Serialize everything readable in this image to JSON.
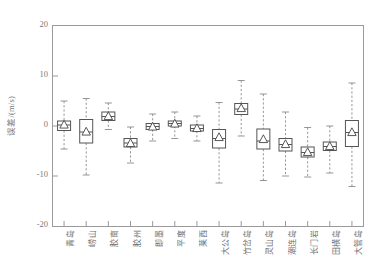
{
  "chart_data": {
    "type": "boxplot",
    "title": "",
    "xlabel": "",
    "ylabel": "误差/(m/s)",
    "ylim": [
      -20,
      20
    ],
    "yticks": [
      20,
      10,
      0,
      -10,
      -20
    ],
    "ytick_labels": [
      "20",
      "10",
      "0",
      "-10",
      "-20"
    ],
    "grid": false,
    "legend": null,
    "marker_note": "triangle = mean, horizontal line in box = median, dashed lines = whiskers",
    "categories": [
      "青岛",
      "崂山",
      "胶南",
      "胶州",
      "即墨",
      "平度",
      "莱西",
      "大公岛",
      "竹岔岛",
      "灵山岛",
      "潮连岛",
      "长门岩",
      "田横岛",
      "大管岛"
    ],
    "boxes": [
      {
        "category": "青岛",
        "whisker_low": -4.6,
        "q1": -0.9,
        "median": 0.2,
        "mean": 0.3,
        "q3": 1.0,
        "whisker_high": 5.0
      },
      {
        "category": "崂山",
        "whisker_low": -9.8,
        "q1": -3.4,
        "median": -1.2,
        "mean": -1.1,
        "q3": 1.3,
        "whisker_high": 5.5
      },
      {
        "category": "胶南",
        "whisker_low": -0.7,
        "q1": 1.1,
        "median": 1.9,
        "mean": 2.0,
        "q3": 2.8,
        "whisker_high": 4.6
      },
      {
        "category": "胶州",
        "whisker_low": -7.4,
        "q1": -4.2,
        "median": -3.4,
        "mean": -3.4,
        "q3": -2.5,
        "whisker_high": -0.2
      },
      {
        "category": "即墨",
        "whisker_low": -3.0,
        "q1": -0.7,
        "median": -0.1,
        "mean": -0.1,
        "q3": 0.5,
        "whisker_high": 2.4
      },
      {
        "category": "平度",
        "whisker_low": -2.5,
        "q1": 0.0,
        "median": 0.5,
        "mean": 0.5,
        "q3": 1.0,
        "whisker_high": 2.8
      },
      {
        "category": "莱西",
        "whisker_low": -3.0,
        "q1": -1.0,
        "median": -0.5,
        "mean": -0.4,
        "q3": 0.2,
        "whisker_high": 2.0
      },
      {
        "category": "大公岛",
        "whisker_low": -11.4,
        "q1": -4.4,
        "median": -2.5,
        "mean": -2.2,
        "q3": -0.7,
        "whisker_high": 4.7
      },
      {
        "category": "竹岔岛",
        "whisker_low": -2.0,
        "q1": 2.3,
        "median": 3.4,
        "mean": 3.6,
        "q3": 4.5,
        "whisker_high": 9.1
      },
      {
        "category": "灵山岛",
        "whisker_low": -10.9,
        "q1": -4.6,
        "median": -3.0,
        "mean": -2.6,
        "q3": -0.6,
        "whisker_high": 6.4
      },
      {
        "category": "潮连岛",
        "whisker_low": -10.0,
        "q1": -5.0,
        "median": -3.7,
        "mean": -3.6,
        "q3": -2.5,
        "whisker_high": 2.8
      },
      {
        "category": "长门岩",
        "whisker_low": -10.2,
        "q1": -6.2,
        "median": -5.3,
        "mean": -5.2,
        "q3": -4.2,
        "whisker_high": -0.3
      },
      {
        "category": "田横岛",
        "whisker_low": -9.4,
        "q1": -4.9,
        "median": -4.1,
        "mean": -4.0,
        "q3": -3.2,
        "whisker_high": 0.0
      },
      {
        "category": "大管岛",
        "whisker_low": -12.1,
        "q1": -4.1,
        "median": -1.3,
        "mean": -1.2,
        "q3": 1.1,
        "whisker_high": 8.6
      }
    ]
  },
  "style": {
    "axis_color": "#9a9a9a",
    "box_color": "#555555",
    "whisker_color": "#8a8a8a",
    "text_color": "#6e6e6e",
    "background": "#ffffff"
  }
}
